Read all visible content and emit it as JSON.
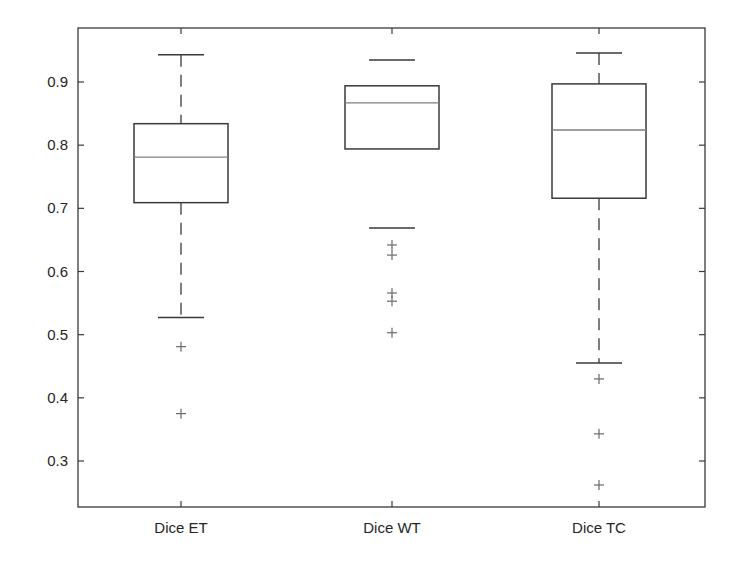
{
  "chart_data": {
    "type": "boxplot",
    "title": "",
    "xlabel": "",
    "ylabel": "",
    "ylim": [
      0.23,
      0.98
    ],
    "yticks": [
      0.3,
      0.4,
      0.5,
      0.6,
      0.7,
      0.8,
      0.9
    ],
    "ytick_labels": [
      "0.3",
      "0.4",
      "0.5",
      "0.6",
      "0.7",
      "0.8",
      "0.9"
    ],
    "grid": false,
    "legend": null,
    "categories": [
      "Dice ET",
      "Dice WT",
      "Dice TC"
    ],
    "series": [
      {
        "name": "Dice ET",
        "whisker_high": 0.943,
        "q3": 0.834,
        "median": 0.781,
        "q1": 0.709,
        "whisker_low": 0.527,
        "outliers": [
          0.481,
          0.375
        ],
        "show_whisker_lines": true
      },
      {
        "name": "Dice WT",
        "whisker_high": 0.935,
        "q3": 0.894,
        "median": 0.867,
        "q1": 0.794,
        "whisker_low": 0.669,
        "outliers": [
          0.642,
          0.626,
          0.566,
          0.553,
          0.503
        ],
        "show_whisker_lines": false
      },
      {
        "name": "Dice TC",
        "whisker_high": 0.946,
        "q3": 0.897,
        "median": 0.824,
        "q1": 0.716,
        "whisker_low": 0.455,
        "outliers": [
          0.43,
          0.343,
          0.262
        ],
        "show_whisker_lines": true
      }
    ],
    "colors": {
      "axes": "#3a3a3a",
      "box": "#3a3a3a",
      "median": "#808080",
      "whisker": "#3a3a3a",
      "outlier": "#6a6a6a",
      "text": "#262626"
    }
  }
}
